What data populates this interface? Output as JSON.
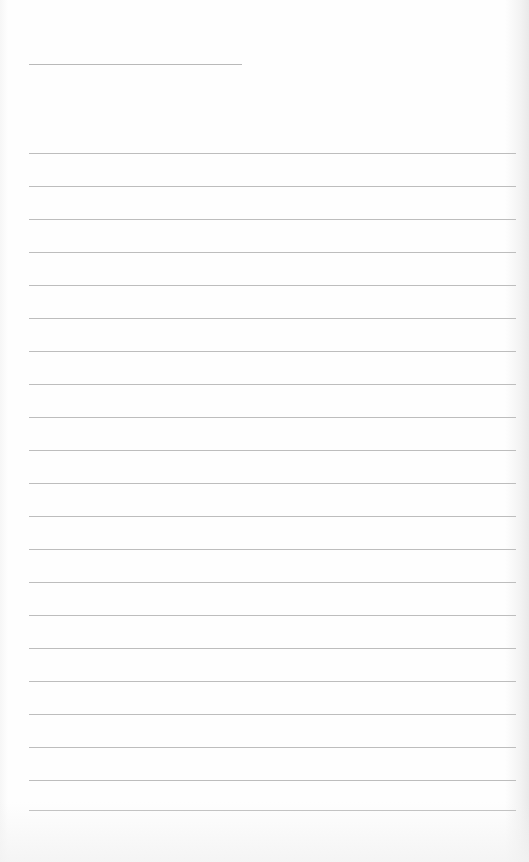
{
  "document": {
    "type": "blank lined sheet",
    "title_line": {
      "text": "",
      "top": 64,
      "left": 29,
      "width": 213
    },
    "ruled_lines": {
      "count": 21,
      "left": 29,
      "width": 487,
      "tops": [
        153,
        186,
        219,
        252,
        285,
        318,
        351,
        384,
        417,
        450,
        483,
        516,
        549,
        582,
        615,
        648,
        681,
        714,
        747,
        780,
        810
      ],
      "entries": [
        "",
        "",
        "",
        "",
        "",
        "",
        "",
        "",
        "",
        "",
        "",
        "",
        "",
        "",
        "",
        "",
        "",
        "",
        "",
        "",
        ""
      ]
    },
    "colors": {
      "paper": "#fdfdfd",
      "line": "#bdbdbd"
    }
  }
}
